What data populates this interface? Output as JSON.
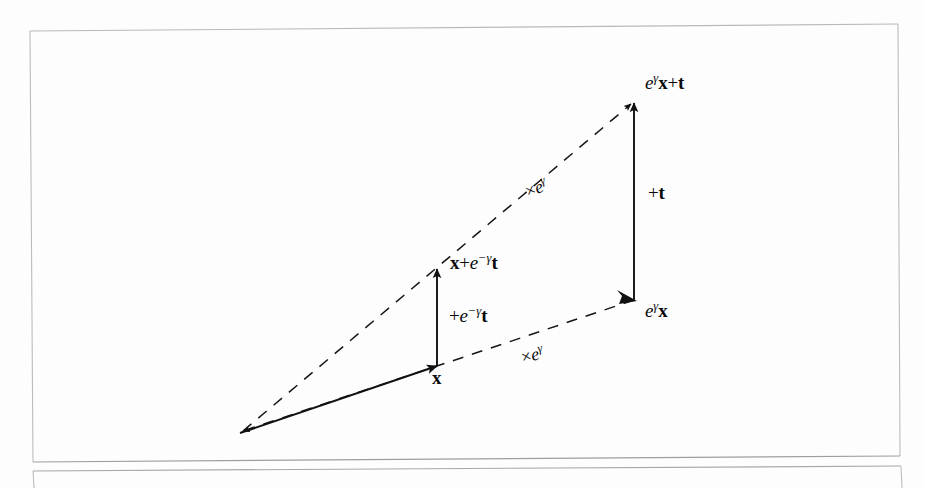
{
  "document": {
    "type": "scanned-figure",
    "page_background": "#fdfdfd",
    "ink_color": "#111111",
    "frame_color": "#b9b9b9"
  },
  "figure": {
    "name": "vector-transformation-diagram",
    "labels": {
      "origin_vector": {
        "id": "label-x",
        "text_plain": "x",
        "parts": [
          {
            "t": "x",
            "style": "bold"
          }
        ],
        "x": 432,
        "y": 368
      },
      "scaled_vector": {
        "id": "label-e-gamma-x",
        "text_plain": "e^γ x",
        "parts": [
          {
            "t": "e",
            "style": "italic"
          },
          {
            "t": "γ",
            "style": "sup"
          },
          {
            "t": "x",
            "style": "bold"
          }
        ],
        "x": 645,
        "y": 300
      },
      "translated_vector": {
        "id": "label-x-plus-e-neg-gamma-t",
        "text_plain": "x + e^−γ t",
        "parts": [
          {
            "t": "x",
            "style": "bold"
          },
          {
            "t": "+",
            "style": "op"
          },
          {
            "t": "e",
            "style": "italic"
          },
          {
            "t": "−γ",
            "style": "sup"
          },
          {
            "t": "t",
            "style": "bold"
          }
        ],
        "x": 450,
        "y": 252
      },
      "final_vector": {
        "id": "label-e-gamma-x-plus-t",
        "text_plain": "e^γ x + t",
        "parts": [
          {
            "t": "e",
            "style": "italic"
          },
          {
            "t": "γ",
            "style": "sup"
          },
          {
            "t": "x",
            "style": "bold"
          },
          {
            "t": "+",
            "style": "op"
          },
          {
            "t": "t",
            "style": "bold"
          }
        ],
        "x": 645,
        "y": 72
      },
      "translation_small": {
        "id": "label-plus-e-neg-gamma-t",
        "text_plain": "+ e^−γ t",
        "parts": [
          {
            "t": "+",
            "style": "op"
          },
          {
            "t": "e",
            "style": "italic"
          },
          {
            "t": "−γ",
            "style": "sup"
          },
          {
            "t": "t",
            "style": "bold"
          }
        ],
        "x": 449,
        "y": 305
      },
      "translation_large": {
        "id": "label-plus-t",
        "text_plain": "+ t",
        "parts": [
          {
            "t": "+",
            "style": "op"
          },
          {
            "t": "t",
            "style": "bold"
          }
        ],
        "x": 648,
        "y": 183
      },
      "scaling_lower": {
        "id": "label-times-e-gamma-lower",
        "text_plain": "× e^γ",
        "parts": [
          {
            "t": "×",
            "style": "times"
          },
          {
            "t": "e",
            "style": "italic"
          },
          {
            "t": "γ",
            "style": "sup"
          }
        ],
        "x": 519,
        "y": 348,
        "rotation_deg": -14
      },
      "scaling_upper": {
        "id": "label-times-e-gamma-upper",
        "text_plain": "× e^γ",
        "parts": [
          {
            "t": "×",
            "style": "times"
          },
          {
            "t": "e",
            "style": "italic"
          },
          {
            "t": "γ",
            "style": "sup"
          }
        ],
        "x": 522,
        "y": 183,
        "rotation_deg": -22
      }
    },
    "geometry": {
      "origin": {
        "x": 240,
        "y": 433
      },
      "point_x": {
        "x": 437,
        "y": 366
      },
      "point_x_plus_t": {
        "x": 437,
        "y": 268
      },
      "point_ egx": {
        "x": 634,
        "y": 300
      },
      "point_egx_plus_t": {
        "x": 634,
        "y": 101
      },
      "solid_arrows": [
        {
          "name": "origin-to-x",
          "from": [
            240,
            433
          ],
          "to": [
            437,
            366
          ]
        },
        {
          "name": "x-to-x-plus-t",
          "from": [
            437,
            366
          ],
          "to": [
            437,
            268
          ]
        },
        {
          "name": "egx-to-egx-plus-t",
          "from": [
            634,
            300
          ],
          "to": [
            634,
            101
          ]
        }
      ],
      "dashed_arrows": [
        {
          "name": "origin-to-egx",
          "from": [
            240,
            433
          ],
          "to": [
            634,
            300
          ]
        },
        {
          "name": "origin-to-egx-plus-t",
          "from": [
            240,
            433
          ],
          "to": [
            634,
            101
          ]
        }
      ]
    }
  },
  "frame": {
    "name": "page-frame",
    "top_left": [
      30,
      31
    ],
    "top_right": [
      898,
      24
    ],
    "bottom_left": [
      33,
      462
    ],
    "bottom_right": [
      900,
      456
    ],
    "second_rule_left": [
      33,
      471
    ],
    "second_rule_right": [
      901,
      466
    ]
  }
}
